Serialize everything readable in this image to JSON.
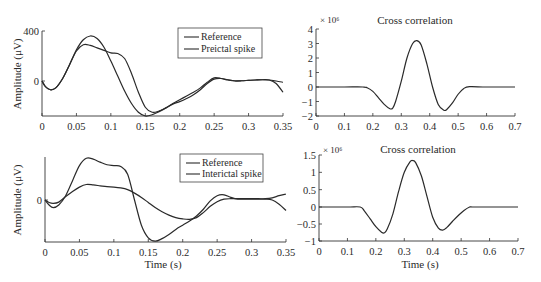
{
  "chart_data": [
    {
      "id": "top-left",
      "type": "line",
      "title": "",
      "xlabel": "",
      "ylabel": "Amplitude (μV)",
      "xlim": [
        0,
        0.35
      ],
      "ylim": [
        -280,
        400
      ],
      "xticks": [
        0,
        0.05,
        0.1,
        0.15,
        0.2,
        0.25,
        0.3,
        0.35
      ],
      "xtick_labels": [
        "0",
        "0.05",
        "0.1",
        "0.15",
        "0.2",
        "0.25",
        "0.3",
        "0.35"
      ],
      "yticks": [
        0,
        400
      ],
      "ytick_labels": [
        "0",
        "400"
      ],
      "legend": {
        "position": "upper-right",
        "entries": [
          "Reference",
          "Preictal spike"
        ]
      },
      "series": [
        {
          "name": "Reference",
          "x": [
            0,
            0.005,
            0.012,
            0.02,
            0.03,
            0.04,
            0.05,
            0.06,
            0.07,
            0.08,
            0.09,
            0.1,
            0.11,
            0.12,
            0.13,
            0.14,
            0.15,
            0.16,
            0.17,
            0.18,
            0.19,
            0.2,
            0.21,
            0.22,
            0.23,
            0.24,
            0.25,
            0.26,
            0.27,
            0.28,
            0.29,
            0.3,
            0.31,
            0.32,
            0.33,
            0.34,
            0.35
          ],
          "values": [
            0,
            -45,
            -70,
            -55,
            20,
            130,
            250,
            330,
            360,
            340,
            270,
            160,
            40,
            -80,
            -180,
            -250,
            -280,
            -270,
            -245,
            -215,
            -180,
            -150,
            -120,
            -90,
            -55,
            -10,
            25,
            20,
            8,
            0,
            2,
            5,
            8,
            10,
            8,
            -20,
            -90
          ]
        },
        {
          "name": "Preictal spike",
          "x": [
            0,
            0.005,
            0.012,
            0.02,
            0.03,
            0.04,
            0.05,
            0.06,
            0.07,
            0.08,
            0.09,
            0.1,
            0.11,
            0.12,
            0.13,
            0.14,
            0.15,
            0.16,
            0.17,
            0.18,
            0.19,
            0.2,
            0.21,
            0.22,
            0.23,
            0.24,
            0.25,
            0.26,
            0.27,
            0.28,
            0.29,
            0.3,
            0.31,
            0.32,
            0.33,
            0.34,
            0.35
          ],
          "values": [
            0,
            -45,
            -70,
            -55,
            20,
            130,
            240,
            290,
            285,
            265,
            245,
            225,
            220,
            180,
            60,
            -90,
            -210,
            -250,
            -240,
            -215,
            -185,
            -165,
            -140,
            -110,
            -70,
            -20,
            15,
            20,
            10,
            2,
            2,
            5,
            8,
            10,
            8,
            0,
            -10
          ]
        }
      ]
    },
    {
      "id": "top-right",
      "type": "line",
      "title": "Cross correlation",
      "xlabel": "",
      "ylabel": "",
      "scale_label": "× 10⁶",
      "xlim": [
        0,
        0.7
      ],
      "ylim": [
        -2,
        4
      ],
      "xticks": [
        0,
        0.1,
        0.2,
        0.3,
        0.4,
        0.5,
        0.6,
        0.7
      ],
      "xtick_labels": [
        "0",
        "0.1",
        "0.2",
        "0.3",
        "0.4",
        "0.5",
        "0.6",
        "0.7"
      ],
      "yticks": [
        -2,
        -1,
        0,
        1,
        2,
        3,
        4
      ],
      "ytick_labels": [
        "−2",
        "−1",
        "0",
        "1",
        "2",
        "3",
        "4"
      ],
      "series": [
        {
          "name": "Cross correlation",
          "x": [
            0,
            0.1,
            0.165,
            0.18,
            0.2,
            0.22,
            0.24,
            0.26,
            0.27,
            0.28,
            0.3,
            0.32,
            0.34,
            0.355,
            0.37,
            0.39,
            0.41,
            0.43,
            0.45,
            0.46,
            0.48,
            0.5,
            0.52,
            0.54,
            0.6,
            0.7
          ],
          "values": [
            0,
            0,
            0,
            -0.05,
            -0.3,
            -0.75,
            -1.2,
            -1.5,
            -1.45,
            -1.0,
            0.4,
            2.0,
            3.0,
            3.2,
            2.9,
            1.6,
            0.0,
            -1.2,
            -1.6,
            -1.55,
            -1.1,
            -0.5,
            -0.1,
            0.02,
            0.0,
            0.0
          ]
        }
      ]
    },
    {
      "id": "bottom-left",
      "type": "line",
      "title": "",
      "xlabel": "Time (s)",
      "ylabel": "Amplitude (μV)",
      "xlim": [
        0,
        0.35
      ],
      "ylim": [
        -1.0,
        1.0
      ],
      "xticks": [
        0,
        0.05,
        0.1,
        0.15,
        0.2,
        0.25,
        0.3,
        0.35
      ],
      "xtick_labels": [
        "0",
        "0.05",
        "0.1",
        "0.15",
        "0.2",
        "0.25",
        "0.3",
        "0.35"
      ],
      "yticks": [
        0
      ],
      "ytick_labels": [
        "0"
      ],
      "legend": {
        "position": "upper-right",
        "entries": [
          "Reference",
          "Interictal spike"
        ]
      },
      "series": [
        {
          "name": "Reference",
          "x": [
            0,
            0.006,
            0.012,
            0.02,
            0.03,
            0.04,
            0.05,
            0.06,
            0.07,
            0.08,
            0.09,
            0.1,
            0.11,
            0.12,
            0.13,
            0.14,
            0.15,
            0.16,
            0.17,
            0.18,
            0.19,
            0.2,
            0.21,
            0.22,
            0.23,
            0.24,
            0.25,
            0.26,
            0.27,
            0.28,
            0.29,
            0.3,
            0.31,
            0.32,
            0.33,
            0.34,
            0.35
          ],
          "values": [
            0,
            -0.12,
            -0.18,
            -0.12,
            0.1,
            0.45,
            0.8,
            0.97,
            0.95,
            0.88,
            0.82,
            0.8,
            0.78,
            0.6,
            0.0,
            -0.6,
            -0.9,
            -0.98,
            -0.92,
            -0.82,
            -0.7,
            -0.6,
            -0.5,
            -0.38,
            -0.22,
            -0.02,
            0.1,
            0.12,
            0.06,
            0.02,
            0.02,
            0.02,
            0.02,
            0.02,
            0.0,
            -0.1,
            -0.25
          ]
        },
        {
          "name": "Interictal spike",
          "x": [
            0,
            0.006,
            0.012,
            0.02,
            0.03,
            0.04,
            0.05,
            0.06,
            0.07,
            0.08,
            0.09,
            0.1,
            0.11,
            0.12,
            0.13,
            0.14,
            0.15,
            0.16,
            0.17,
            0.18,
            0.19,
            0.2,
            0.21,
            0.22,
            0.23,
            0.24,
            0.25,
            0.26,
            0.27,
            0.28,
            0.29,
            0.3,
            0.31,
            0.32,
            0.33,
            0.34,
            0.35
          ],
          "values": [
            0,
            -0.06,
            -0.08,
            -0.05,
            0.08,
            0.2,
            0.3,
            0.36,
            0.35,
            0.33,
            0.31,
            0.3,
            0.28,
            0.24,
            0.16,
            0.06,
            -0.06,
            -0.18,
            -0.28,
            -0.36,
            -0.42,
            -0.45,
            -0.46,
            -0.42,
            -0.3,
            -0.15,
            -0.04,
            0.02,
            0.03,
            0.03,
            0.03,
            0.03,
            0.03,
            0.03,
            0.05,
            0.1,
            0.14
          ]
        }
      ]
    },
    {
      "id": "bottom-right",
      "type": "line",
      "title": "Cross correlation",
      "xlabel": "Time (s)",
      "ylabel": "",
      "scale_label": "× 10⁶",
      "xlim": [
        0,
        0.7
      ],
      "ylim": [
        -1,
        1.5
      ],
      "xticks": [
        0,
        0.1,
        0.2,
        0.3,
        0.4,
        0.5,
        0.6,
        0.7
      ],
      "xtick_labels": [
        "0",
        "0.1",
        "0.2",
        "0.3",
        "0.4",
        "0.5",
        "0.6",
        "0.7"
      ],
      "yticks": [
        -1,
        -0.5,
        0,
        0.5,
        1,
        1.5
      ],
      "ytick_labels": [
        "−1",
        "−0.5",
        "0",
        "0.5",
        "1",
        "1.5"
      ],
      "series": [
        {
          "name": "Cross correlation",
          "x": [
            0,
            0.1,
            0.145,
            0.16,
            0.18,
            0.2,
            0.22,
            0.23,
            0.24,
            0.26,
            0.28,
            0.3,
            0.32,
            0.33,
            0.34,
            0.36,
            0.38,
            0.4,
            0.42,
            0.435,
            0.45,
            0.47,
            0.49,
            0.51,
            0.53,
            0.54,
            0.6,
            0.7
          ],
          "values": [
            0,
            0,
            0,
            -0.12,
            -0.35,
            -0.58,
            -0.74,
            -0.76,
            -0.65,
            -0.2,
            0.45,
            1.0,
            1.3,
            1.34,
            1.28,
            0.9,
            0.3,
            -0.3,
            -0.62,
            -0.68,
            -0.6,
            -0.42,
            -0.25,
            -0.1,
            0.0,
            0.0,
            0.0,
            0.0
          ]
        }
      ]
    }
  ],
  "panels": {
    "top_left": {
      "ylabel": "Amplitude (μV)",
      "legend": [
        "Reference",
        "Preictal spike"
      ]
    },
    "top_right": {
      "title": "Cross correlation",
      "scale": "× 10⁶"
    },
    "bottom_left": {
      "ylabel": "Amplitude (μV)",
      "xlabel": "Time (s)",
      "legend": [
        "Reference",
        "Interictal spike"
      ]
    },
    "bottom_right": {
      "title": "Cross correlation",
      "scale": "× 10⁶",
      "xlabel": "Time (s)"
    }
  },
  "style": {
    "line_color": "#2a2a2a",
    "axis_color": "#333333",
    "background": "#ffffff"
  }
}
